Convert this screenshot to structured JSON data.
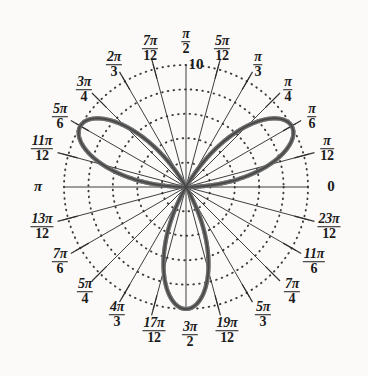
{
  "figure": {
    "title": "",
    "background_color": "#fbfaf8",
    "curve_color": "#6b6b6b",
    "curve_highlight_color": "#3c3c3c",
    "grid_color": "#2b2b2b",
    "text_color": "#1b1b1b"
  },
  "radial_axis": {
    "max_label": "10",
    "max_value": 10,
    "gridline_values": [
      2,
      4,
      6,
      8,
      10
    ],
    "gridline_style": "dotted"
  },
  "angular_labels": [
    {
      "angle_deg": 0,
      "display": "0",
      "type": "plain",
      "num": "",
      "den": "",
      "x": 331,
      "y": 186
    },
    {
      "angle_deg": 15,
      "display": "pi/12",
      "type": "fraction",
      "num": "π",
      "den": "12",
      "x": 327,
      "y": 149
    },
    {
      "angle_deg": 30,
      "display": "pi/6",
      "type": "fraction",
      "num": "π",
      "den": "6",
      "x": 312,
      "y": 117
    },
    {
      "angle_deg": 45,
      "display": "pi/4",
      "type": "fraction",
      "num": "π",
      "den": "4",
      "x": 288,
      "y": 90
    },
    {
      "angle_deg": 60,
      "display": "pi/3",
      "type": "fraction",
      "num": "π",
      "den": "3",
      "x": 258,
      "y": 65
    },
    {
      "angle_deg": 75,
      "display": "5pi/12",
      "type": "fraction",
      "num": "5π",
      "den": "12",
      "x": 222,
      "y": 49
    },
    {
      "angle_deg": 90,
      "display": "pi/2",
      "type": "fraction",
      "num": "π",
      "den": "2",
      "x": 186,
      "y": 42
    },
    {
      "angle_deg": 105,
      "display": "7pi/12",
      "type": "fraction",
      "num": "7π",
      "den": "12",
      "x": 150,
      "y": 49
    },
    {
      "angle_deg": 120,
      "display": "2pi/3",
      "type": "fraction",
      "num": "2π",
      "den": "3",
      "x": 114,
      "y": 65
    },
    {
      "angle_deg": 135,
      "display": "3pi/4",
      "type": "fraction",
      "num": "3π",
      "den": "4",
      "x": 84,
      "y": 90
    },
    {
      "angle_deg": 150,
      "display": "5pi/6",
      "type": "fraction",
      "num": "5π",
      "den": "6",
      "x": 60,
      "y": 117
    },
    {
      "angle_deg": 165,
      "display": "11pi/12",
      "type": "fraction",
      "num": "11π",
      "den": "12",
      "x": 42,
      "y": 149
    },
    {
      "angle_deg": 180,
      "display": "pi",
      "type": "plain",
      "num": "π",
      "den": "",
      "x": 38,
      "y": 186
    },
    {
      "angle_deg": 195,
      "display": "13pi/12",
      "type": "fraction",
      "num": "13π",
      "den": "12",
      "x": 42,
      "y": 227
    },
    {
      "angle_deg": 210,
      "display": "7pi/6",
      "type": "fraction",
      "num": "7π",
      "den": "6",
      "x": 60,
      "y": 262
    },
    {
      "angle_deg": 225,
      "display": "5pi/4",
      "type": "fraction",
      "num": "5π",
      "den": "4",
      "x": 85,
      "y": 292
    },
    {
      "angle_deg": 240,
      "display": "4pi/3",
      "type": "fraction",
      "num": "4π",
      "den": "3",
      "x": 117,
      "y": 315
    },
    {
      "angle_deg": 255,
      "display": "17pi/12",
      "type": "fraction",
      "num": "17π",
      "den": "12",
      "x": 154,
      "y": 331
    },
    {
      "angle_deg": 270,
      "display": "3pi/2",
      "type": "fraction",
      "num": "3π",
      "den": "2",
      "x": 190,
      "y": 335
    },
    {
      "angle_deg": 285,
      "display": "19pi/12",
      "type": "fraction",
      "num": "19π",
      "den": "12",
      "x": 227,
      "y": 331
    },
    {
      "angle_deg": 300,
      "display": "5pi/3",
      "type": "fraction",
      "num": "5π",
      "den": "3",
      "x": 263,
      "y": 315
    },
    {
      "angle_deg": 315,
      "display": "7pi/4",
      "type": "fraction",
      "num": "7π",
      "den": "4",
      "x": 292,
      "y": 292
    },
    {
      "angle_deg": 330,
      "display": "11pi/6",
      "type": "fraction",
      "num": "11π",
      "den": "6",
      "x": 314,
      "y": 262
    },
    {
      "angle_deg": 345,
      "display": "23pi/12",
      "type": "fraction",
      "num": "23π",
      "den": "12",
      "x": 329,
      "y": 227
    }
  ],
  "chart_data": {
    "type": "line",
    "plot_kind": "polar-rose",
    "title": "",
    "xlabel": "",
    "ylabel": "",
    "equation": "r = 10 sin(6θ)",
    "petal_count": 12,
    "amplitude": 10,
    "k": 6,
    "rlim": [
      0,
      10
    ],
    "theta_range_deg": [
      0,
      360
    ],
    "grid": true,
    "legend": "none",
    "angular_tick_count": 24,
    "angular_tick_step_deg": 15,
    "radial_tick_values": [
      2,
      4,
      6,
      8,
      10
    ],
    "radial_tick_labels": [
      "",
      "",
      "",
      "",
      "10"
    ],
    "petal_tip_angles_deg": [
      0,
      30,
      60,
      90,
      120,
      150,
      180,
      210,
      240,
      270,
      300,
      330
    ],
    "petal_tip_radii": [
      10,
      10,
      10,
      10,
      10,
      10,
      10,
      10,
      10,
      10,
      10,
      10
    ],
    "series": [
      {
        "name": "r = 10 sin(6θ)",
        "color": "#6b6b6b",
        "linewidth": 3
      }
    ]
  }
}
